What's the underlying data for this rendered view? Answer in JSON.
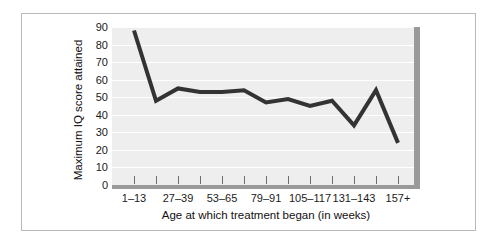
{
  "figure": {
    "background_color": "#ffffff",
    "frame_color": "#b9b9b9",
    "panel_color": "#eeeeee",
    "gridline_color": "#ffffff",
    "axis_bar_color": "#9a9a9a",
    "line_color": "#333333"
  },
  "chart_data": {
    "type": "line",
    "title": "",
    "subtitle": "",
    "xlabel": "Age at which treatment began (in weeks)",
    "ylabel": "Maximum IQ score attained",
    "ylim": [
      0,
      90
    ],
    "yticks": [
      0,
      10,
      20,
      30,
      40,
      50,
      60,
      70,
      80,
      90
    ],
    "ytick_labels": [
      "0",
      "10",
      "20",
      "30",
      "40",
      "50",
      "60",
      "70",
      "80",
      "90"
    ],
    "grid": true,
    "grid_axis": "y",
    "legend": null,
    "legend_position": "none",
    "x_tick_count": 13,
    "categories": [
      "1–13",
      "14–26",
      "27–39",
      "40–52",
      "53–65",
      "66–78",
      "79–91",
      "92–104",
      "105–117",
      "118–130",
      "131–143",
      "144–156",
      "157+"
    ],
    "xtick_labels_shown": [
      {
        "index": 0,
        "label": "1–13"
      },
      {
        "index": 2,
        "label": "27–39"
      },
      {
        "index": 4,
        "label": "53–65"
      },
      {
        "index": 6,
        "label": "79–91"
      },
      {
        "index": 8,
        "label": "105–117"
      },
      {
        "index": 10,
        "label": "131–143"
      },
      {
        "index": 12,
        "label": "157+"
      }
    ],
    "values": [
      88,
      48,
      55,
      53,
      53,
      54,
      47,
      49,
      45,
      48,
      34,
      54,
      24
    ],
    "series": [
      {
        "name": "Maximum IQ score attained",
        "values": [
          88,
          48,
          55,
          53,
          53,
          54,
          47,
          49,
          45,
          48,
          34,
          54,
          24
        ]
      }
    ]
  }
}
